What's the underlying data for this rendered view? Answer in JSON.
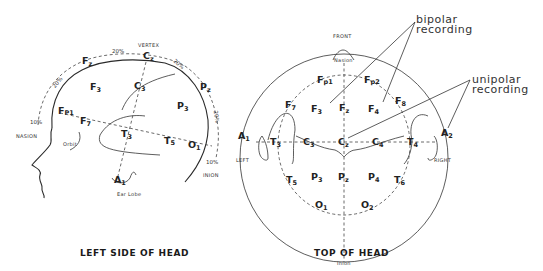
{
  "side_view": {
    "caption": "LEFT SIDE OF HEAD",
    "landmarks": {
      "vertex": "VERTEX",
      "nasion": "NASION",
      "inion": "INION",
      "orbit": "Orbit",
      "ear_lobe": "Ear Lobe"
    },
    "percentages": [
      "10%",
      "20%",
      "20%",
      "20%",
      "20%",
      "10%"
    ],
    "electrodes": {
      "Fz": {
        "main": "F",
        "sub": "z"
      },
      "Cz": {
        "main": "C",
        "sub": "z"
      },
      "Pz": {
        "main": "P",
        "sub": "z"
      },
      "F3": {
        "main": "F",
        "sub": "3"
      },
      "C3": {
        "main": "C",
        "sub": "3"
      },
      "P3": {
        "main": "P",
        "sub": "3"
      },
      "Fp1": {
        "main": "F",
        "sub": "P1"
      },
      "F7": {
        "main": "F",
        "sub": "7"
      },
      "T3": {
        "main": "T",
        "sub": "3"
      },
      "T5": {
        "main": "T",
        "sub": "5"
      },
      "O1": {
        "main": "O",
        "sub": "1"
      },
      "A1": {
        "main": "A",
        "sub": "1"
      }
    }
  },
  "top_view": {
    "caption": "TOP OF HEAD",
    "landmarks": {
      "front": "FRONT",
      "nasion": "Nasion",
      "inion": "Inion",
      "left": "LEFT",
      "right": "RIGHT"
    },
    "electrodes": {
      "Fp1": {
        "main": "F",
        "sub": "p1"
      },
      "Fp2": {
        "main": "F",
        "sub": "p2"
      },
      "F7": {
        "main": "F",
        "sub": "7"
      },
      "F3": {
        "main": "F",
        "sub": "3"
      },
      "Fz": {
        "main": "F",
        "sub": "z"
      },
      "F4": {
        "main": "F",
        "sub": "4"
      },
      "F8": {
        "main": "F",
        "sub": "8"
      },
      "A1": {
        "main": "A",
        "sub": "1"
      },
      "T3": {
        "main": "T",
        "sub": "3"
      },
      "C3": {
        "main": "C",
        "sub": "3"
      },
      "Cz": {
        "main": "C",
        "sub": "z"
      },
      "C4": {
        "main": "C",
        "sub": "4"
      },
      "T4": {
        "main": "T",
        "sub": "4"
      },
      "A2": {
        "main": "A",
        "sub": "2"
      },
      "T5": {
        "main": "T",
        "sub": "5"
      },
      "P3": {
        "main": "P",
        "sub": "3"
      },
      "Pz": {
        "main": "P",
        "sub": "z"
      },
      "P4": {
        "main": "P",
        "sub": "4"
      },
      "T6": {
        "main": "T",
        "sub": "6"
      },
      "O1": {
        "main": "O",
        "sub": "1"
      },
      "O2": {
        "main": "O",
        "sub": "2"
      }
    }
  },
  "annotations": {
    "bipolar": [
      "bipolar",
      "recording"
    ],
    "unipolar": [
      "unipolar",
      "recording"
    ]
  }
}
